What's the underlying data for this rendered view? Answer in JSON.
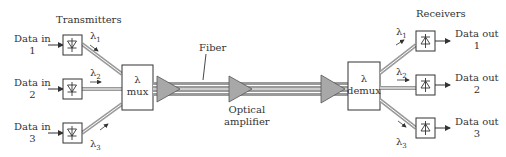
{
  "diagram": {
    "transmitters_label": "Transmitters",
    "receivers_label": "Receivers",
    "fiber_label": "Fiber",
    "amplifier_label_line1": "Optical",
    "amplifier_label_line2": "amplifier",
    "mux": {
      "symbol": "λ",
      "label": "mux"
    },
    "demux": {
      "symbol": "λ",
      "label": "demux"
    },
    "inputs": [
      {
        "line1": "Data in",
        "line2": "1",
        "wavelength": "λ",
        "sub": "1"
      },
      {
        "line1": "Data in",
        "line2": "2",
        "wavelength": "λ",
        "sub": "2"
      },
      {
        "line1": "Data in",
        "line2": "3",
        "wavelength": "λ",
        "sub": "3"
      }
    ],
    "outputs": [
      {
        "line1": "Data out",
        "line2": "1",
        "wavelength": "λ",
        "sub": "1"
      },
      {
        "line1": "Data out",
        "line2": "2",
        "wavelength": "λ",
        "sub": "2"
      },
      {
        "line1": "Data out",
        "line2": "3",
        "wavelength": "λ",
        "sub": "3"
      }
    ],
    "colors": {
      "fiber": "#9a9a9a",
      "amplifier": "#a8a8a8",
      "stroke": "#333333"
    }
  }
}
